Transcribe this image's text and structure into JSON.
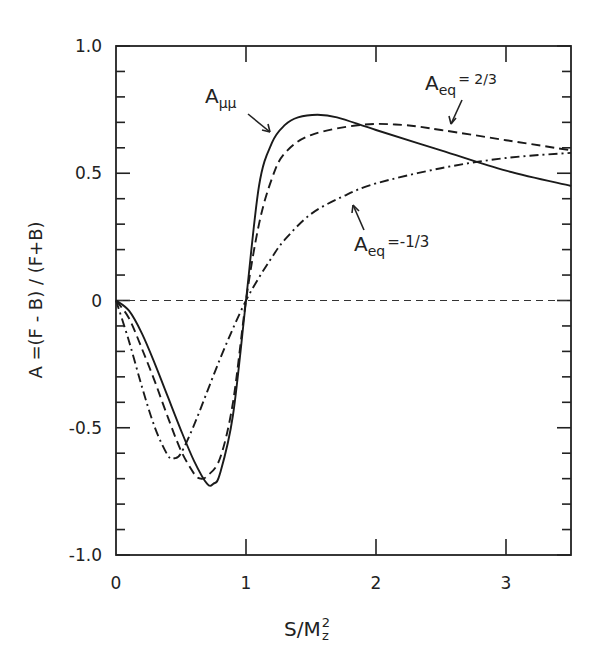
{
  "chart_data": {
    "type": "line",
    "title": "",
    "xlabel": "S/M_z^2",
    "xlabel_main": "S/M",
    "xlabel_sup": "2",
    "xlabel_sub": "z",
    "ylabel": "A =(F - B) / (F+B)",
    "xlim": [
      0,
      3.5
    ],
    "ylim": [
      -1.0,
      1.0
    ],
    "x_ticks": [
      0,
      1,
      2,
      3
    ],
    "x_tick_labels": [
      "0",
      "1",
      "2",
      "3"
    ],
    "y_ticks": [
      1.0,
      0.5,
      0,
      -0.5,
      -1.0
    ],
    "y_tick_labels": [
      "1.0",
      "0.5",
      "0",
      "-0.5",
      "-1.0"
    ],
    "y_minor_step": 0.1,
    "grid": false,
    "reference_line": {
      "y": 0,
      "style": "dashed"
    },
    "series": [
      {
        "name": "A_μμ",
        "style": "solid",
        "x": [
          0,
          0.1,
          0.2,
          0.3,
          0.4,
          0.5,
          0.6,
          0.7,
          0.75,
          0.8,
          0.9,
          1.0,
          1.1,
          1.2,
          1.3,
          1.4,
          1.55,
          1.7,
          2.0,
          2.5,
          3.0,
          3.5
        ],
        "values": [
          0,
          -0.04,
          -0.13,
          -0.25,
          -0.38,
          -0.51,
          -0.63,
          -0.72,
          -0.72,
          -0.68,
          -0.45,
          0.0,
          0.45,
          0.62,
          0.69,
          0.72,
          0.73,
          0.72,
          0.67,
          0.59,
          0.51,
          0.45
        ]
      },
      {
        "name": "A_eq = 2/3",
        "style": "dashed",
        "x": [
          0,
          0.1,
          0.2,
          0.3,
          0.4,
          0.5,
          0.6,
          0.65,
          0.7,
          0.8,
          0.9,
          1.0,
          1.1,
          1.2,
          1.3,
          1.5,
          1.88,
          2.2,
          2.5,
          3.0,
          3.5
        ],
        "values": [
          0,
          -0.07,
          -0.19,
          -0.32,
          -0.46,
          -0.59,
          -0.68,
          -0.7,
          -0.69,
          -0.62,
          -0.4,
          0.0,
          0.3,
          0.48,
          0.58,
          0.65,
          0.69,
          0.69,
          0.67,
          0.63,
          0.59
        ]
      },
      {
        "name": "A_eq = -1/3",
        "style": "dashdot",
        "x": [
          0,
          0.1,
          0.2,
          0.3,
          0.4,
          0.45,
          0.5,
          0.6,
          0.7,
          0.8,
          0.9,
          1.0,
          1.1,
          1.2,
          1.3,
          1.5,
          1.75,
          2.0,
          2.5,
          3.0,
          3.5
        ],
        "values": [
          0,
          -0.16,
          -0.34,
          -0.5,
          -0.61,
          -0.62,
          -0.6,
          -0.49,
          -0.36,
          -0.23,
          -0.11,
          0.0,
          0.09,
          0.17,
          0.24,
          0.34,
          0.41,
          0.46,
          0.52,
          0.56,
          0.58
        ]
      }
    ],
    "annotations": [
      {
        "text_main": "A",
        "text_sub": "μμ",
        "text_after": "",
        "target_series": "A_μμ"
      },
      {
        "text_main": "A",
        "text_sub": "eq",
        "text_after": "= 2/3",
        "target_series": "A_eq = 2/3"
      },
      {
        "text_main": "A",
        "text_sub": "eq",
        "text_after": "=-1/3",
        "target_series": "A_eq = -1/3"
      }
    ]
  }
}
